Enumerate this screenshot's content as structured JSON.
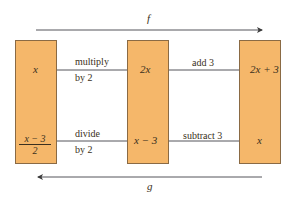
{
  "diagram": {
    "top_label": "f",
    "bottom_label": "g",
    "boxes": [
      {
        "top": "x",
        "bottom_num": "x − 3",
        "bottom_den": "2"
      },
      {
        "top": "2x",
        "bottom": "x − 3"
      },
      {
        "top": "2x + 3",
        "bottom": "x"
      }
    ],
    "forward_steps": [
      {
        "line1": "multiply",
        "line2": "by 2"
      },
      {
        "line1": "add 3"
      }
    ],
    "backward_steps": [
      {
        "line1": "divide",
        "line2": "by 2"
      },
      {
        "line1": "subtract 3"
      }
    ],
    "colors": {
      "box_fill": "#f5b76a",
      "box_border": "#8a6a44",
      "line": "#55555a"
    }
  }
}
